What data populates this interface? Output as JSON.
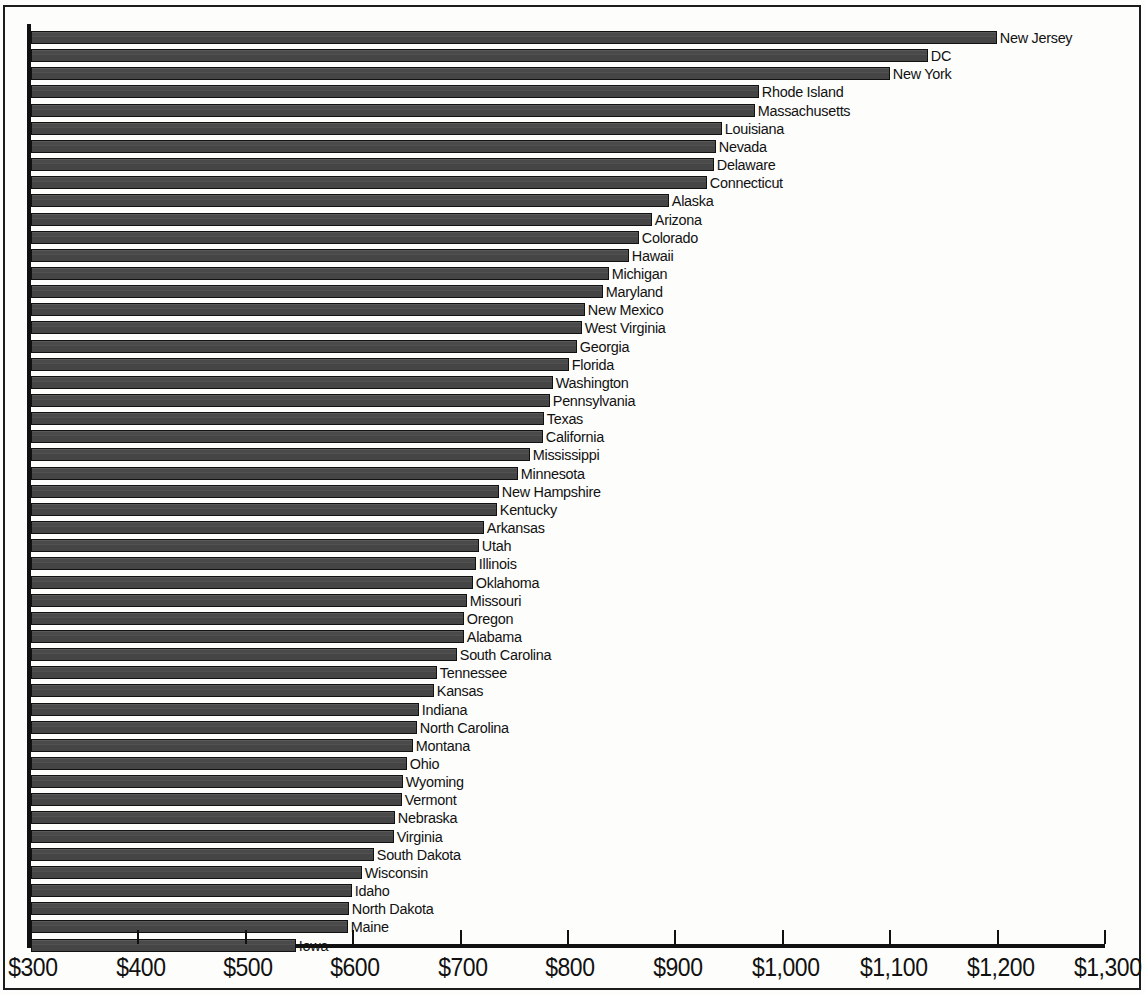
{
  "chart_data": {
    "type": "bar",
    "orientation": "horizontal",
    "title": "",
    "subtitle": "",
    "xlabel": "",
    "ylabel": "",
    "xlim": [
      300,
      1300
    ],
    "grid": false,
    "legend": null,
    "value_prefix": "$",
    "axis": {
      "tick_labels": [
        "$300",
        "$400",
        "$500",
        "$600",
        "$700",
        "$800",
        "$900",
        "$1,000",
        "$1,100",
        "$1,200",
        "$1,300"
      ],
      "tick_values": [
        300,
        400,
        500,
        600,
        700,
        800,
        900,
        1000,
        1100,
        1200,
        1300
      ]
    },
    "bar_color": "#4d4d4d",
    "bar_outline_color": "#111111",
    "categories": [
      "New Jersey",
      "DC",
      "New York",
      "Rhode Island",
      "Massachusetts",
      "Louisiana",
      "Nevada",
      "Delaware",
      "Connecticut",
      "Alaska",
      "Arizona",
      "Colorado",
      "Hawaii",
      "Michigan",
      "Maryland",
      "New Mexico",
      "West Virginia",
      "Georgia",
      "Florida",
      "Washington",
      "Pennsylvania",
      "Texas",
      "California",
      "Mississippi",
      "Minnesota",
      "New Hampshire",
      "Kentucky",
      "Arkansas",
      "Utah",
      "Illinois",
      "Oklahoma",
      "Missouri",
      "Oregon",
      "Alabama",
      "South Carolina",
      "Tennessee",
      "Kansas",
      "Indiana",
      "North Carolina",
      "Montana",
      "Ohio",
      "Wyoming",
      "Vermont",
      "Nebraska",
      "Virginia",
      "South Dakota",
      "Wisconsin",
      "Idaho",
      "North Dakota",
      "Maine",
      "Iowa"
    ],
    "values": [
      1199,
      1135,
      1100,
      978,
      974,
      943,
      938,
      936,
      929,
      894,
      878,
      866,
      857,
      838,
      833,
      816,
      813,
      808,
      801,
      786,
      783,
      778,
      777,
      765,
      753,
      736,
      734,
      722,
      717,
      714,
      712,
      706,
      703,
      703,
      697,
      678,
      675,
      661,
      659,
      656,
      650,
      646,
      645,
      639,
      638,
      619,
      608,
      599,
      596,
      595,
      547
    ]
  }
}
